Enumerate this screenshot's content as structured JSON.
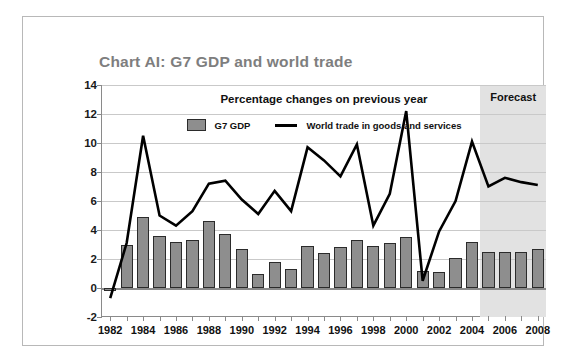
{
  "chart_data": {
    "type": "bar",
    "title": "Chart AI: G7 GDP and world trade",
    "subtitle": "Percentage changes on previous year",
    "xlabel": "",
    "ylabel": "",
    "ylim": [
      -2,
      14
    ],
    "ytick_labels": [
      "14",
      "12",
      "10",
      "8",
      "6",
      "4",
      "2",
      "0",
      "-2"
    ],
    "ytick_values": [
      14,
      12,
      10,
      8,
      6,
      4,
      2,
      0,
      -2
    ],
    "grid": true,
    "legend_position": "top-center",
    "x": [
      1982,
      1983,
      1984,
      1985,
      1986,
      1987,
      1988,
      1989,
      1990,
      1991,
      1992,
      1993,
      1994,
      1995,
      1996,
      1997,
      1998,
      1999,
      2000,
      2001,
      2002,
      2003,
      2004,
      2005,
      2006,
      2007,
      2008
    ],
    "xtick_labels": [
      "1982",
      "1984",
      "1986",
      "1988",
      "1990",
      "1992",
      "1994",
      "1996",
      "1998",
      "2000",
      "2002",
      "2004",
      "2006",
      "2008"
    ],
    "xtick_values": [
      1982,
      1984,
      1986,
      1988,
      1990,
      1992,
      1994,
      1996,
      1998,
      2000,
      2002,
      2004,
      2006,
      2008
    ],
    "series": [
      {
        "name": "G7 GDP",
        "type": "bar",
        "color": "#8e8e8e",
        "values": [
          -0.2,
          3.0,
          4.9,
          3.6,
          3.2,
          3.3,
          4.6,
          3.7,
          2.7,
          1.0,
          1.8,
          1.3,
          2.9,
          2.4,
          2.8,
          3.3,
          2.9,
          3.1,
          3.5,
          1.2,
          1.1,
          2.1,
          3.2,
          2.5,
          2.5,
          2.5,
          2.7
        ]
      },
      {
        "name": "World trade in goods and services",
        "type": "line",
        "color": "#000000",
        "values": [
          -0.7,
          3.1,
          10.5,
          5.0,
          4.3,
          5.3,
          7.2,
          7.4,
          6.1,
          5.1,
          6.7,
          5.3,
          9.7,
          8.8,
          7.7,
          9.9,
          4.3,
          6.5,
          12.2,
          0.5,
          3.9,
          6.0,
          10.1,
          7.0,
          7.6,
          7.3,
          7.1
        ]
      }
    ],
    "annotations": [
      {
        "name": "forecast",
        "label": "Forecast",
        "start_year": 2004.5,
        "end_year": 2008.5
      }
    ]
  },
  "legend": [
    {
      "label": "G7 GDP",
      "marker": "bar-swatch"
    },
    {
      "label": "World trade in goods and services",
      "marker": "line-swatch"
    }
  ]
}
